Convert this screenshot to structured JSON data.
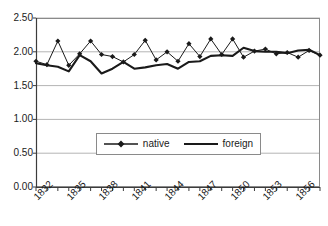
{
  "chart_data": {
    "type": "line",
    "title": "",
    "xlabel": "",
    "ylabel": "",
    "ylim": [
      0.0,
      2.5
    ],
    "ytick_labels": [
      "0.00",
      "0.50",
      "1.00",
      "1.50",
      "2.00",
      "2.50"
    ],
    "ytick_values": [
      0.0,
      0.5,
      1.0,
      1.5,
      2.0,
      2.5
    ],
    "xtick_labels": [
      "1832",
      "1835",
      "1838",
      "1841",
      "1844",
      "1847",
      "1850",
      "1853",
      "1856"
    ],
    "xtick_values": [
      1832,
      1835,
      1838,
      1841,
      1844,
      1847,
      1850,
      1853,
      1856
    ],
    "x": [
      1831,
      1832,
      1833,
      1834,
      1835,
      1836,
      1837,
      1838,
      1839,
      1840,
      1841,
      1842,
      1843,
      1844,
      1845,
      1846,
      1847,
      1848,
      1849,
      1850,
      1851,
      1852,
      1853,
      1854,
      1855,
      1856,
      1857
    ],
    "grid": "horizontal",
    "legend_position": "inside-center-lower",
    "series": [
      {
        "name": "native",
        "marker": "diamond",
        "color": "#1a1a1a",
        "values": [
          1.86,
          1.81,
          2.16,
          1.8,
          1.97,
          2.16,
          1.96,
          1.93,
          1.85,
          1.96,
          2.17,
          1.88,
          2.0,
          1.86,
          2.12,
          1.93,
          2.19,
          1.96,
          2.19,
          1.92,
          2.01,
          2.04,
          1.97,
          1.99,
          1.92,
          2.02,
          1.95
        ]
      },
      {
        "name": "foreign",
        "marker": "none",
        "color": "#1a1a1a",
        "values": [
          1.83,
          1.8,
          1.78,
          1.71,
          1.95,
          1.86,
          1.68,
          1.75,
          1.85,
          1.75,
          1.77,
          1.8,
          1.82,
          1.75,
          1.85,
          1.86,
          1.94,
          1.95,
          1.94,
          2.06,
          2.01,
          2.0,
          2.0,
          1.98,
          2.02,
          2.03,
          1.95
        ]
      }
    ]
  },
  "legend": {
    "items": [
      {
        "label": "native",
        "style": "line-with-diamond"
      },
      {
        "label": "foreign",
        "style": "line"
      }
    ]
  },
  "plot_geometry": {
    "left": 36,
    "right": 320,
    "top": 18,
    "bottom": 187
  }
}
